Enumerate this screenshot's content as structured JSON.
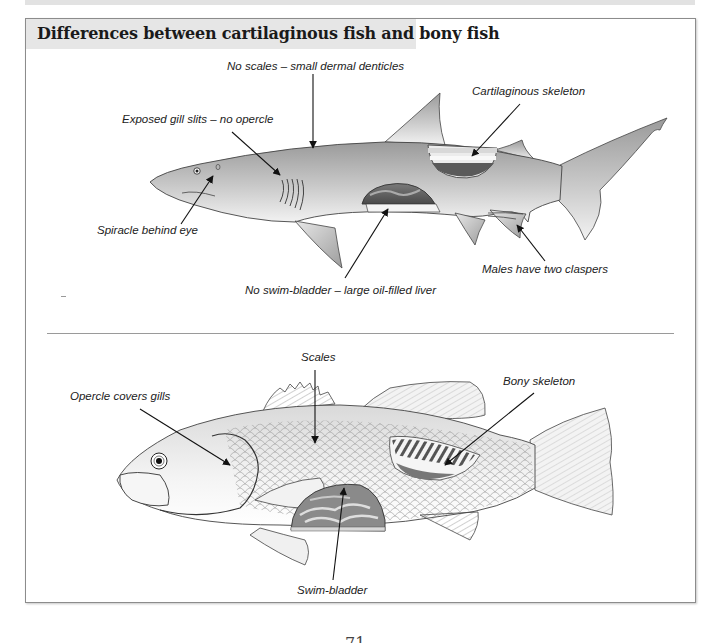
{
  "header": {
    "title": "Differences between cartilaginous fish and bony fish"
  },
  "sections": {
    "cartilaginous": {
      "subject": "shark",
      "labels": {
        "scales": "No scales – small dermal denticles",
        "gills": "Exposed gill slits – no opercle",
        "skeleton": "Cartilaginous skeleton",
        "spiracle": "Spiracle behind eye",
        "claspers": "Males have two claspers",
        "liver": "No swim-bladder – large oil-filled liver"
      }
    },
    "bony": {
      "subject": "bony fish (bass)",
      "labels": {
        "scales": "Scales",
        "opercle": "Opercle covers gills",
        "skeleton": "Bony skeleton",
        "swim_bladder": "Swim-bladder"
      }
    }
  },
  "footer": {
    "page_number": "71"
  },
  "colors": {
    "frame_border": "#8c8c8c",
    "title_bg": "#e6e6e6",
    "shark_body": "#b5b5b5",
    "fish_body": "#eeeeee"
  }
}
